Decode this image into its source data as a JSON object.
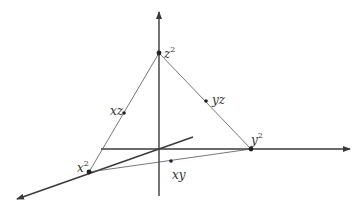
{
  "diagram": {
    "type": "3d-axes-simplex",
    "colors": {
      "axis": "#3a3a3a",
      "edge": "#555555",
      "point": "#222222",
      "background": "#ffffff"
    },
    "points": [
      {
        "id": "z2",
        "label": "z",
        "exponent": "2",
        "x": 159,
        "y": 53
      },
      {
        "id": "y2",
        "label": "y",
        "exponent": "2",
        "x": 251,
        "y": 149
      },
      {
        "id": "x2",
        "label": "x",
        "exponent": "2",
        "x": 89,
        "y": 172
      },
      {
        "id": "xz",
        "label": "xz",
        "exponent": "",
        "x": 124,
        "y": 113
      },
      {
        "id": "yz",
        "label": "yz",
        "exponent": "",
        "x": 206,
        "y": 101
      },
      {
        "id": "xy",
        "label": "xy",
        "exponent": "",
        "x": 171,
        "y": 161
      }
    ]
  }
}
